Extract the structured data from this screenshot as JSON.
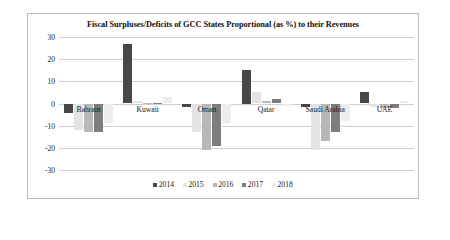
{
  "chart_data": {
    "type": "bar",
    "title": "Fiscal Surpluses/Deficits of GCC States Proportional (as %) to their Revenues",
    "xlabel": "",
    "ylabel": "",
    "ylim": [
      -30,
      30
    ],
    "yticks": [
      30,
      20,
      10,
      0,
      -10,
      -20,
      -30
    ],
    "ytick_labels": [
      "30",
      "20",
      "10",
      "0",
      "-10",
      "-20",
      "-30"
    ],
    "grid": true,
    "legend_position": "bottom",
    "categories": [
      "Bahrain",
      "Kuwait",
      "Oman",
      "Qatar",
      "Saudi Arabia",
      "UAE"
    ],
    "series": [
      {
        "name": "2014",
        "color": "#474747",
        "values": [
          -4.5,
          27.0,
          -1.5,
          15.0,
          -1.5,
          5.0
        ]
      },
      {
        "name": "2015",
        "color": "#e3e3e3",
        "values": [
          -12.0,
          1.0,
          -13.0,
          5.0,
          -21.0,
          -1.5
        ]
      },
      {
        "name": "2016",
        "color": "#b8b8b8",
        "values": [
          -13.0,
          0.4,
          -21.0,
          1.0,
          -17.0,
          -2.0
        ]
      },
      {
        "name": "2017",
        "color": "#7d7d7d",
        "values": [
          -13.0,
          0.4,
          -19.0,
          2.0,
          -13.0,
          -2.0
        ]
      },
      {
        "name": "2018",
        "color": "#ededed",
        "values": [
          -9.0,
          3.0,
          -9.0,
          -1.0,
          -8.0,
          1.0
        ]
      }
    ]
  }
}
